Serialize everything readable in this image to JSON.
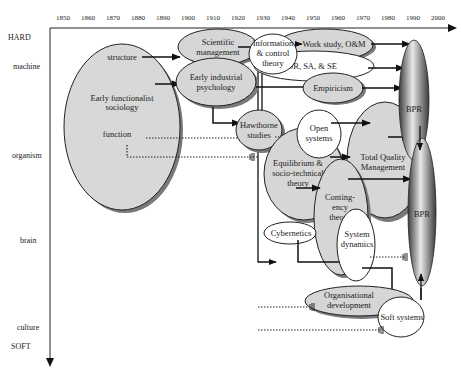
{
  "x_axis": {
    "years": [
      "1850",
      "1860",
      "1870",
      "1880",
      "1890",
      "1900",
      "1910",
      "1920",
      "1930",
      "1940",
      "1950",
      "1960",
      "1970",
      "1980",
      "1990",
      "2000"
    ]
  },
  "y_axis": {
    "top": "HARD",
    "levels": [
      "machine",
      "organism",
      "brain",
      "culture"
    ],
    "bottom": "SOFT"
  },
  "nodes": {
    "early_functionalist": "Early functionalist",
    "sociology": "sociology",
    "structure": "structure",
    "function": "function",
    "scientific": "Scientific",
    "management": "management",
    "early_industrial": "Early industrial",
    "psychology": "psychology",
    "information": "Information",
    "and_control": "& control",
    "theory": "theory",
    "work_study": "Work study, O&M",
    "or_sa_se": "OR, SA, & SE",
    "empiricism": "Empiricism",
    "hawthorne": "Hawthorne",
    "studies": "studies",
    "open": "Open",
    "systems": "systems",
    "equilibrium": "Equilibrium &",
    "socio_technical": "socio-technical",
    "eq_theory": "theory",
    "contingency_1": "Conting-",
    "contingency_2": "ency",
    "contingency_3": "theory",
    "tqm_1": "Total Quality",
    "tqm_2": "Management",
    "cybernetics": "Cybernetics",
    "system": "System",
    "dynamics": "dynamics",
    "organisational": "Organisational",
    "development": "development",
    "soft_systems": "Soft systems",
    "bpr_upper": "BPR",
    "bpr_lower": "BPR"
  },
  "colors": {
    "ellipse_fill": "#d4d4d4",
    "ellipse_shadow": "#7a7a7a",
    "white_fill": "#ffffff",
    "line": "#111111",
    "bpr_dark": "#3a3a3a",
    "bpr_light": "#eeeeee"
  }
}
